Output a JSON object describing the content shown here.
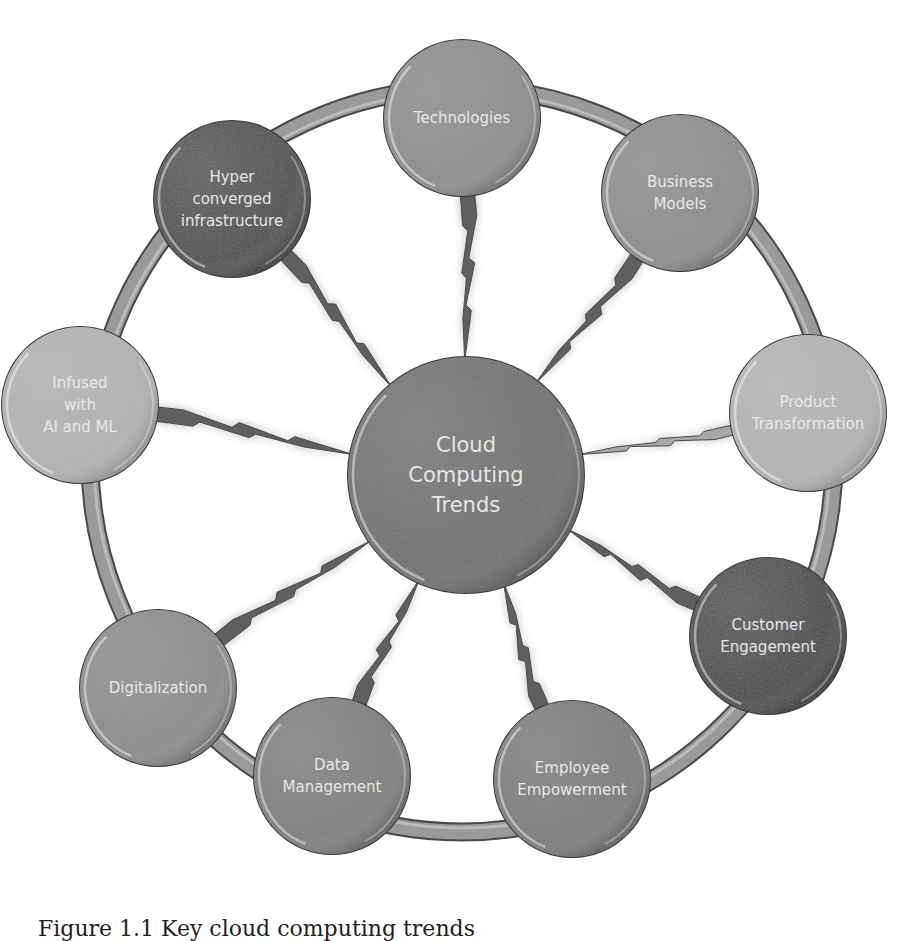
{
  "diagram": {
    "center": {
      "label_lines": [
        "Cloud",
        "Computing",
        "Trends"
      ],
      "x": 466,
      "y": 475,
      "r": 118,
      "color": "#6f6f6f"
    },
    "ring": {
      "cx": 462,
      "cy": 460,
      "r": 372,
      "color": "#8a8a8a",
      "width": 16
    },
    "nodes": [
      {
        "id": "technologies",
        "label_lines": [
          "Technologies"
        ],
        "x": 462,
        "y": 118,
        "r": 78,
        "color": "#8c8c8c"
      },
      {
        "id": "business-models",
        "label_lines": [
          "Business",
          "Models"
        ],
        "x": 680,
        "y": 193,
        "r": 78,
        "color": "#8c8c8c"
      },
      {
        "id": "product-transformation",
        "label_lines": [
          "Product",
          "Transformation"
        ],
        "x": 808,
        "y": 413,
        "r": 78,
        "color": "#b4b4b4"
      },
      {
        "id": "customer-engagement",
        "label_lines": [
          "Customer",
          "Engagement"
        ],
        "x": 768,
        "y": 636,
        "r": 78,
        "color": "#4a4a4a"
      },
      {
        "id": "employee-empowerment",
        "label_lines": [
          "Employee",
          "Empowerment"
        ],
        "x": 572,
        "y": 779,
        "r": 78,
        "color": "#7a7a7a"
      },
      {
        "id": "data-management",
        "label_lines": [
          "Data",
          "Management"
        ],
        "x": 332,
        "y": 776,
        "r": 78,
        "color": "#7e7e7e"
      },
      {
        "id": "digitalization",
        "label_lines": [
          "Digitalization"
        ],
        "x": 158,
        "y": 688,
        "r": 78,
        "color": "#8a8a8a"
      },
      {
        "id": "infused-ai-ml",
        "label_lines": [
          "Infused",
          "with",
          "AI and ML"
        ],
        "x": 80,
        "y": 405,
        "r": 78,
        "color": "#b2b2b2"
      },
      {
        "id": "hyper-converged-infrastructure",
        "label_lines": [
          "Hyper",
          "converged",
          "infrastructure"
        ],
        "x": 232,
        "y": 199,
        "r": 78,
        "color": "#4e4e4e"
      }
    ],
    "connector_color": "#5f5f5f",
    "connector_light_color": "#a8a8a8"
  },
  "caption": "Figure 1.1 Key cloud computing trends"
}
